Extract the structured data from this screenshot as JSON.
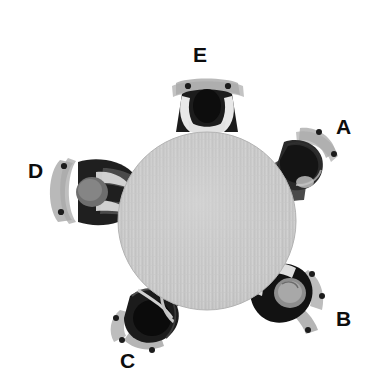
{
  "scene": {
    "title": "Overhead view of five people seated around a round table",
    "width": 378,
    "height": 389,
    "background_color": "#ffffff",
    "view": "top-down"
  },
  "table": {
    "name": "round-table",
    "shape": "circle",
    "center_x": 207,
    "center_y": 221,
    "radius": 89,
    "fill_color": "#c9c9c9",
    "texture": "fine vertical wood-grain striations",
    "texture_light": "#d6d6d6",
    "texture_dark": "#bcbcbc"
  },
  "colors": {
    "hair": "#101010",
    "torso_dark": "#1a1a1a",
    "torso_mid": "#4a4a4a",
    "skin_light": "#e3e3e3",
    "skin_mid": "#c0c0c0",
    "chair": "#b9b9b9",
    "chair_shadow": "#a8a8a8",
    "stud": "#1c1c1c",
    "label_text": "#0d0d0d",
    "background": "#ffffff"
  },
  "seats": [
    {
      "id": "A",
      "label": "A",
      "position": "right-upper",
      "angle_deg": 35,
      "label_x": 336,
      "label_y": 116,
      "person_x": 300,
      "person_y": 160,
      "description": "person seated at upper-right, dark hair, light gray chair arc behind with two dark studs"
    },
    {
      "id": "B",
      "label": "B",
      "position": "right-lower",
      "angle_deg": 325,
      "label_x": 336,
      "label_y": 308,
      "person_x": 296,
      "person_y": 290,
      "description": "person seated at lower-right, dark hair and dark torso, pale face, chair arc with three dark studs"
    },
    {
      "id": "C",
      "label": "C",
      "position": "bottom-left",
      "angle_deg": 250,
      "label_x": 120,
      "label_y": 350,
      "person_x": 150,
      "person_y": 305,
      "description": "person seated at bottom-left with black hair, chair arc below with dark studs"
    },
    {
      "id": "D",
      "label": "D",
      "position": "left",
      "angle_deg": 175,
      "label_x": 28,
      "label_y": 160,
      "person_x": 95,
      "person_y": 192,
      "description": "person seated at left, gray head, dark torso, light arms, chair arc left with two dark studs"
    },
    {
      "id": "E",
      "label": "E",
      "position": "top",
      "angle_deg": 95,
      "label_x": 193,
      "label_y": 44,
      "person_x": 206,
      "person_y": 100,
      "description": "person seated at top, black hair, light arms crossed on table, chair back with two dark studs"
    }
  ]
}
